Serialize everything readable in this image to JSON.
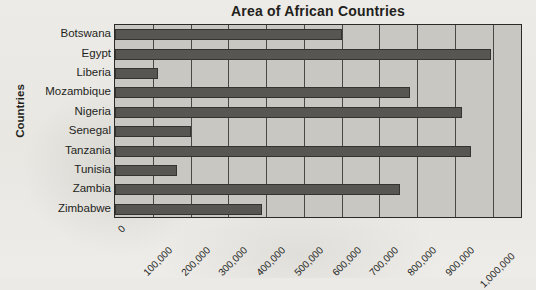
{
  "chart_data": {
    "type": "bar",
    "orientation": "horizontal",
    "title": "Area of African Countries",
    "xlabel": "",
    "ylabel": "Countries",
    "categories": [
      "Botswana",
      "Egypt",
      "Liberia",
      "Mozambique",
      "Nigeria",
      "Senegal",
      "Tanzania",
      "Tunisia",
      "Zambia",
      "Zimbabwe"
    ],
    "values": [
      600000,
      995000,
      114000,
      780000,
      918000,
      201000,
      942000,
      164000,
      754000,
      390000
    ],
    "xlim": [
      0,
      1080000
    ],
    "xticks": [
      0,
      100000,
      200000,
      300000,
      400000,
      500000,
      600000,
      700000,
      800000,
      900000,
      1000000
    ],
    "xticklabels": [
      "0",
      "100,000",
      "200,000",
      "300,000",
      "400,000",
      "500,000",
      "600,000",
      "700,000",
      "800,000",
      "900,000",
      "1,000,000"
    ],
    "grid": "vertical",
    "legend": "none",
    "colors": {
      "bar_fill": "#585653",
      "bar_border": "#35332f",
      "plot_background": "#c9c7c2",
      "figure_background": "#eceae6",
      "axis_line": "#2c2a27",
      "gridline": "#4a4845",
      "text": "#231f1c"
    }
  }
}
